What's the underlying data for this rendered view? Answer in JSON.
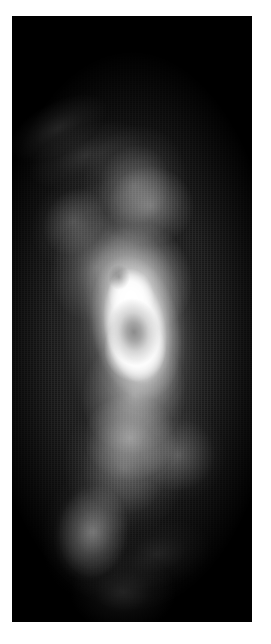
{
  "figure": {
    "kind": "grayscale-intensity-map",
    "width_px": 271,
    "height_px": 644,
    "page_background": "#ffffff",
    "panel": {
      "x": 12,
      "y": 16,
      "width": 240,
      "height": 606,
      "background": "#000000",
      "border": "none"
    },
    "colormap": "grayscale",
    "colormap_low": "#000000",
    "colormap_high": "#ffffff",
    "has_axes": false,
    "has_ticks": false,
    "has_labels": false,
    "has_colorbar": false,
    "has_legend": false,
    "title": "",
    "caption": ""
  },
  "chart_data": {
    "type": "heatmap",
    "title": "",
    "subtitle": "",
    "xlabel": "",
    "ylabel": "",
    "colormap": "gray",
    "grid": false,
    "legend": false,
    "axes_visible": false,
    "tick_labels_x": [],
    "tick_labels_y": [],
    "xlim": [
      0,
      240
    ],
    "ylim": [
      0,
      606
    ],
    "value_range": [
      0,
      255
    ],
    "background_value": 0,
    "peak_value": 255,
    "features": [
      {
        "name": "bright-core",
        "center_x": 121,
        "center_y": 312,
        "radius_x": 30,
        "radius_y": 52,
        "peak_intensity": 255,
        "rotation_deg": -12
      },
      {
        "name": "core-dark-depression",
        "center_x": 122,
        "center_y": 316,
        "radius_x": 13,
        "radius_y": 17,
        "peak_intensity": 120,
        "rotation_deg": -8
      },
      {
        "name": "secondary-dark-knot",
        "center_x": 114,
        "center_y": 276,
        "radius_x": 5,
        "radius_y": 7,
        "peak_intensity": 150,
        "rotation_deg": 0
      },
      {
        "name": "inner-shell-arc",
        "center_x": 124,
        "center_y": 300,
        "radius_x": 56,
        "radius_y": 108,
        "peak_intensity": 150,
        "rotation_deg": -10
      },
      {
        "name": "outer-halo",
        "center_x": 120,
        "center_y": 318,
        "radius_x": 84,
        "radius_y": 176,
        "peak_intensity": 95,
        "rotation_deg": -8
      },
      {
        "name": "upper-plume",
        "center_x": 122,
        "center_y": 170,
        "radius_x": 52,
        "radius_y": 62,
        "peak_intensity": 78,
        "rotation_deg": 18
      },
      {
        "name": "upper-left-streamer",
        "center_x": 62,
        "center_y": 206,
        "radius_x": 40,
        "radius_y": 48,
        "peak_intensity": 62,
        "rotation_deg": 35
      },
      {
        "name": "upper-left-faint-wisp",
        "center_x": 46,
        "center_y": 112,
        "radius_x": 54,
        "radius_y": 26,
        "peak_intensity": 26,
        "rotation_deg": -28
      },
      {
        "name": "lower-plume",
        "center_x": 112,
        "center_y": 452,
        "radius_x": 58,
        "radius_y": 66,
        "peak_intensity": 80,
        "rotation_deg": -14
      },
      {
        "name": "lower-right-lobe",
        "center_x": 166,
        "center_y": 438,
        "radius_x": 42,
        "radius_y": 40,
        "peak_intensity": 66,
        "rotation_deg": 0
      },
      {
        "name": "lower-left-tail",
        "center_x": 82,
        "center_y": 526,
        "radius_x": 42,
        "radius_y": 58,
        "peak_intensity": 58,
        "rotation_deg": 10
      },
      {
        "name": "bottom-faint-extension",
        "center_x": 106,
        "center_y": 576,
        "radius_x": 44,
        "radius_y": 34,
        "peak_intensity": 30,
        "rotation_deg": 0
      }
    ]
  }
}
